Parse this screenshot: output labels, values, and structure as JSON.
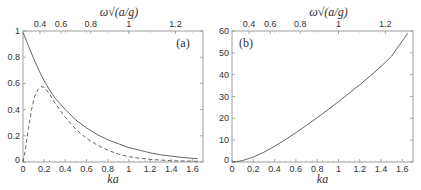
{
  "chart_data": [
    {
      "type": "line",
      "panel_label": "(a)",
      "xlabel": "ka",
      "top_xlabel": "ω√(a/g)",
      "xlim": [
        0,
        1.7
      ],
      "ylim": [
        0,
        1
      ],
      "xticks": [
        0,
        0.2,
        0.4,
        0.6,
        0.8,
        1,
        1.2,
        1.4,
        1.6
      ],
      "xtick_labels": [
        "0",
        "0.2",
        "0.4",
        "0.6",
        "0.8",
        "1",
        "1.2",
        "1.4",
        "1.6"
      ],
      "yticks": [
        0,
        0.2,
        0.4,
        0.6,
        0.8,
        1
      ],
      "ytick_labels": [
        "0",
        "0.2",
        "0.4",
        "0.6",
        "0.8",
        "1"
      ],
      "top_xticks": [
        0.4,
        0.6,
        0.8,
        1,
        1.2
      ],
      "top_xtick_labels": [
        "0.4",
        "0.6",
        "0.8",
        "1",
        "1.2"
      ],
      "grid": false,
      "series": [
        {
          "name": "solid",
          "style": "solid",
          "x": [
            0,
            0.05,
            0.1,
            0.15,
            0.2,
            0.25,
            0.3,
            0.4,
            0.5,
            0.6,
            0.7,
            0.8,
            0.9,
            1.0,
            1.1,
            1.2,
            1.3,
            1.4,
            1.5,
            1.65
          ],
          "y": [
            0.99,
            0.89,
            0.79,
            0.7,
            0.62,
            0.55,
            0.49,
            0.4,
            0.32,
            0.26,
            0.21,
            0.17,
            0.14,
            0.11,
            0.09,
            0.07,
            0.055,
            0.045,
            0.035,
            0.025
          ]
        },
        {
          "name": "dashed",
          "style": "dashed",
          "x": [
            0,
            0.02,
            0.05,
            0.08,
            0.11,
            0.14,
            0.17,
            0.2,
            0.25,
            0.3,
            0.4,
            0.5,
            0.6,
            0.7,
            0.8,
            0.9,
            1.0,
            1.2,
            1.4,
            1.65
          ],
          "y": [
            0.0,
            0.08,
            0.25,
            0.4,
            0.5,
            0.55,
            0.575,
            0.57,
            0.52,
            0.45,
            0.34,
            0.25,
            0.18,
            0.13,
            0.09,
            0.06,
            0.04,
            0.02,
            0.01,
            0.005
          ]
        }
      ]
    },
    {
      "type": "line",
      "panel_label": "(b)",
      "xlabel": "ka",
      "top_xlabel": "ω√(a/g)",
      "xlim": [
        0,
        1.7
      ],
      "ylim": [
        0,
        60
      ],
      "xticks": [
        0,
        0.2,
        0.4,
        0.6,
        0.8,
        1,
        1.2,
        1.4,
        1.6
      ],
      "xtick_labels": [
        "0",
        "0.2",
        "0.4",
        "0.6",
        "0.8",
        "1",
        "1.2",
        "1.4",
        "1.6"
      ],
      "yticks": [
        0,
        10,
        20,
        30,
        40,
        50,
        60
      ],
      "ytick_labels": [
        "0",
        "10",
        "20",
        "30",
        "40",
        "50",
        "60"
      ],
      "top_xticks": [
        0.4,
        0.6,
        0.8,
        1,
        1.2
      ],
      "top_xtick_labels": [
        "0.4",
        "0.6",
        "0.8",
        "1",
        "1.2"
      ],
      "grid": false,
      "series": [
        {
          "name": "solid",
          "style": "solid",
          "x": [
            0,
            0.05,
            0.1,
            0.15,
            0.2,
            0.3,
            0.4,
            0.5,
            0.6,
            0.7,
            0.8,
            0.9,
            1.0,
            1.1,
            1.2,
            1.3,
            1.4,
            1.5,
            1.65
          ],
          "y": [
            0,
            0.2,
            0.7,
            1.4,
            2.3,
            4.5,
            7.2,
            10.2,
            13.4,
            16.8,
            20.3,
            23.9,
            27.6,
            31.5,
            35.4,
            39.5,
            43.8,
            48.5,
            59
          ]
        }
      ]
    }
  ]
}
